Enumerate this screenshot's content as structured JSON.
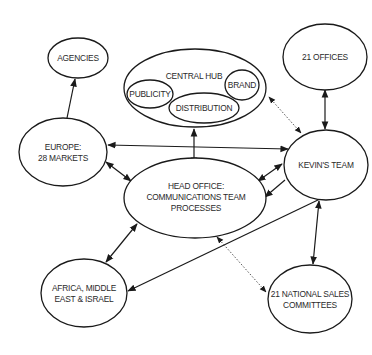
{
  "diagram": {
    "nodes": {
      "agencies": {
        "label": "AGENCIES"
      },
      "central_hub": {
        "label": "CENTRAL HUB"
      },
      "publicity": {
        "label": "PUBLICITY"
      },
      "brand": {
        "label": "BRAND"
      },
      "distribution": {
        "label": "DISTRIBUTION"
      },
      "offices": {
        "label": "21 OFFICES"
      },
      "europe": {
        "line1": "EUROPE:",
        "line2": "28 MARKETS"
      },
      "kevins_team": {
        "label": "KEVIN'S TEAM"
      },
      "head_office": {
        "line1": "HEAD OFFICE:",
        "line2": "COMMUNICATIONS TEAM",
        "line3": "PROCESSES"
      },
      "africa": {
        "line1": "AFRICA, MIDDLE",
        "line2": "EAST & ISRAEL"
      },
      "sales_committees": {
        "line1": "21 NATIONAL SALES",
        "line2": "COMMITTEES"
      }
    },
    "edges": [
      {
        "from": "europe",
        "to": "agencies",
        "style": "solid",
        "direction": "forward"
      },
      {
        "from": "europe",
        "to": "kevins_team",
        "style": "solid",
        "direction": "both"
      },
      {
        "from": "europe",
        "to": "head_office",
        "style": "solid",
        "direction": "both"
      },
      {
        "from": "central_hub",
        "to": "head_office",
        "style": "solid",
        "direction": "both"
      },
      {
        "from": "central_hub",
        "to": "kevins_team",
        "style": "dotted",
        "direction": "both"
      },
      {
        "from": "offices",
        "to": "kevins_team",
        "style": "solid",
        "direction": "both"
      },
      {
        "from": "kevins_team",
        "to": "head_office",
        "style": "solid",
        "direction": "both"
      },
      {
        "from": "kevins_team",
        "to": "head_office",
        "style": "solid",
        "direction": "forward"
      },
      {
        "from": "kevins_team",
        "to": "africa",
        "style": "solid",
        "direction": "forward"
      },
      {
        "from": "kevins_team",
        "to": "sales_committees",
        "style": "solid",
        "direction": "both"
      },
      {
        "from": "head_office",
        "to": "africa",
        "style": "solid",
        "direction": "both"
      },
      {
        "from": "head_office",
        "to": "sales_committees",
        "style": "dotted",
        "direction": "both"
      }
    ],
    "colors": {
      "stroke": "#1a1a1a",
      "text": "#2a2a2a",
      "background": "#ffffff"
    }
  }
}
